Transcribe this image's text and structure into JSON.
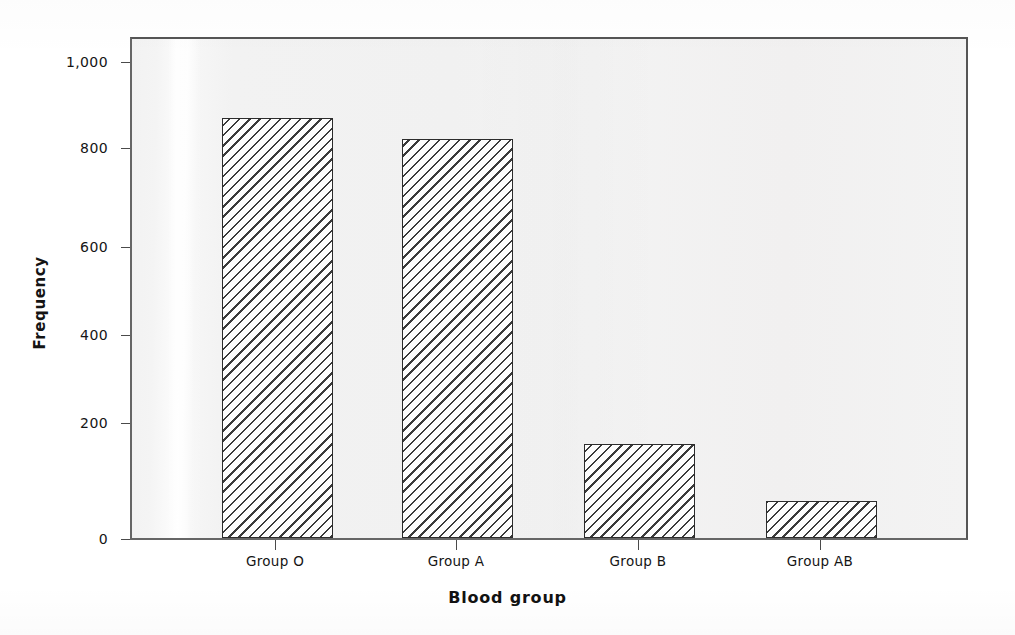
{
  "chart_data": {
    "type": "bar",
    "title": "",
    "xlabel": "Blood group",
    "ylabel": "Frequency",
    "categories": [
      "Group O",
      "Group A",
      "Group B",
      "Group AB"
    ],
    "values": [
      883,
      839,
      197,
      77
    ],
    "ylim": [
      0,
      1050
    ],
    "yticks": [
      0,
      200,
      400,
      600,
      800,
      1000
    ],
    "ytick_labels": [
      "0",
      "200",
      "400",
      "600",
      "800",
      "1,000"
    ],
    "grid": false,
    "legend": false,
    "bar_style": "diagonal-hatch",
    "colors": {
      "bar_outline": "#2c2c2c",
      "bar_hatch": "#3a3a3a",
      "plot_background": "#f2f2f2",
      "frame": "#666666",
      "text": "#141414"
    }
  },
  "axes": {
    "y_title": "Frequency",
    "x_title": "Blood group",
    "y_ticks": [
      {
        "label": "1,000",
        "value": 1000
      },
      {
        "label": "800",
        "value": 800
      },
      {
        "label": "600",
        "value": 600
      },
      {
        "label": "400",
        "value": 400
      },
      {
        "label": "200",
        "value": 200
      },
      {
        "label": "0",
        "value": 0
      }
    ],
    "x_ticks": [
      {
        "label": "Group O"
      },
      {
        "label": "Group A"
      },
      {
        "label": "Group B"
      },
      {
        "label": "Group AB"
      }
    ]
  }
}
